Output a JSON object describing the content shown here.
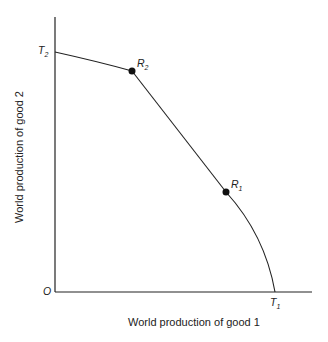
{
  "diagram": {
    "type": "production-possibility-frontier",
    "origin_label": "O",
    "x_axis_title": "World production of good 1",
    "y_axis_title": "World production of good 2",
    "points": [
      {
        "id": "T2",
        "base": "T",
        "sub": "2",
        "x": 55,
        "y": 52
      },
      {
        "id": "R2",
        "base": "R",
        "sub": "2",
        "x": 132,
        "y": 71
      },
      {
        "id": "R1",
        "base": "R",
        "sub": "1",
        "x": 226,
        "y": 192
      },
      {
        "id": "T1",
        "base": "T",
        "sub": "1",
        "x": 275,
        "y": 292
      }
    ],
    "colors": {
      "line": "#222222",
      "background": "#ffffff"
    }
  }
}
